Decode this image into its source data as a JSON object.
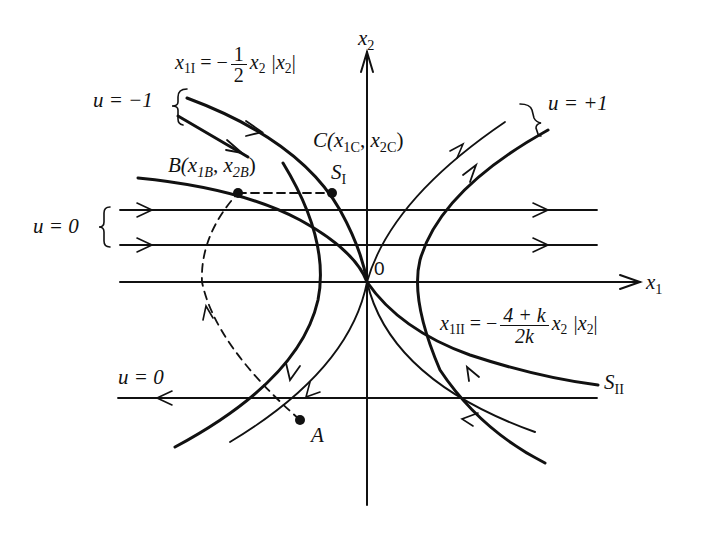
{
  "figure": {
    "type": "phase-plane diagram",
    "axes": {
      "x_label": "x",
      "x_sub": "1",
      "y_label": "x",
      "y_sub": "2",
      "origin_label": "0"
    },
    "colors": {
      "ink": "#111111",
      "background": "#ffffff"
    }
  },
  "labels": {
    "u_minus1": "u = −1",
    "u_plus1": "u = +1",
    "u_zero_upper": "u = 0",
    "u_zero_lower": "u = 0",
    "switch_I_eq": {
      "lhs": "x",
      "lhs_sub": "1I",
      "eq": "= −",
      "num": "1",
      "den": "2",
      "rhs": "x",
      "rhs_sub": "2",
      "abs": "|x",
      "abs_sub": "2",
      "abs_close": "|"
    },
    "switch_II_eq": {
      "lhs": "x",
      "lhs_sub": "1II",
      "eq": "= −",
      "num": "4 + k",
      "den": "2k",
      "rhs": "x",
      "rhs_sub": "2",
      "abs": "|x",
      "abs_sub": "2",
      "abs_close": "|"
    },
    "point_C": {
      "name": "C(",
      "x": "x",
      "x_sub": "1C",
      "sep": ", ",
      "y": "x",
      "y_sub": "2C",
      "close": ")"
    },
    "point_B": {
      "name": "B(",
      "x": "x",
      "x_sub": "1B",
      "sep": ", ",
      "y": "x",
      "y_sub": "2B",
      "close": ")"
    },
    "S_I": {
      "name": "S",
      "sub": "I"
    },
    "S_II": {
      "name": "S",
      "sub": "II"
    },
    "point_A": "A"
  }
}
